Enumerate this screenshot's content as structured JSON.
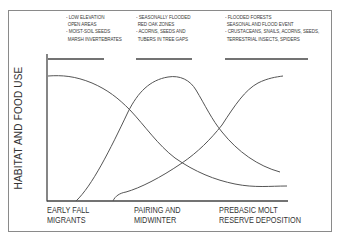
{
  "diagram": {
    "y_axis_label": "HABITAT AND FOOD USE",
    "phases": [
      {
        "label_line1": "EARLY FALL",
        "label_line2": "MIGRANTS",
        "notes": [
          "- LOW ELEVATION",
          "  OPEN AREAS",
          "- MOIST-SOIL SEEDS",
          "  MARSH INVERTEBRATES"
        ]
      },
      {
        "label_line1": "PAIRING AND",
        "label_line2": "MIDWINTER",
        "notes": [
          "- SEASONALLY FLOODED",
          "  RED OAK ZONES",
          "- ACORNS, SEEDS AND",
          "  TUBERS IN TREE GAPS"
        ]
      },
      {
        "label_line1": "PREBASIC MOLT",
        "label_line2": "RESERVE DEPOSITION",
        "notes": [
          "- FLOODED FORESTS",
          "  SEASONAL AND FLOOD EVENT",
          "- CRUSTACEANS, SNAILS, ACORNS, SEEDS,",
          "  TERRESTRIAL INSECTS, SPIDERS"
        ]
      }
    ],
    "curves": [
      {
        "name": "early-fall-habitat-curve",
        "shape": "high-then-declining"
      },
      {
        "name": "midwinter-habitat-curve",
        "shape": "bell-peak-midwinter"
      },
      {
        "name": "prebasic-molt-habitat-curve",
        "shape": "rising-to-high"
      }
    ],
    "colors": {
      "line": "#555555",
      "frame": "#8a8a8a",
      "text": "#333333"
    }
  }
}
